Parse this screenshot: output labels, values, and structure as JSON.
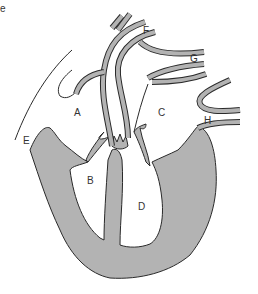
{
  "diagram": {
    "corner_text": "e",
    "labels": [
      {
        "id": "A",
        "text": "A",
        "x": 74,
        "y": 108
      },
      {
        "id": "B",
        "text": "B",
        "x": 87,
        "y": 176
      },
      {
        "id": "C",
        "text": "C",
        "x": 158,
        "y": 108
      },
      {
        "id": "D",
        "text": "D",
        "x": 138,
        "y": 202
      },
      {
        "id": "E",
        "text": "E",
        "x": 23,
        "y": 136
      },
      {
        "id": "F",
        "text": "F",
        "x": 143,
        "y": 26
      },
      {
        "id": "G",
        "text": "G",
        "x": 190,
        "y": 54
      },
      {
        "id": "H",
        "text": "H",
        "x": 204,
        "y": 116
      }
    ],
    "colors": {
      "wall_fill": "#b3b3b3",
      "outline": "#2a2a2a",
      "background": "#ffffff"
    }
  }
}
